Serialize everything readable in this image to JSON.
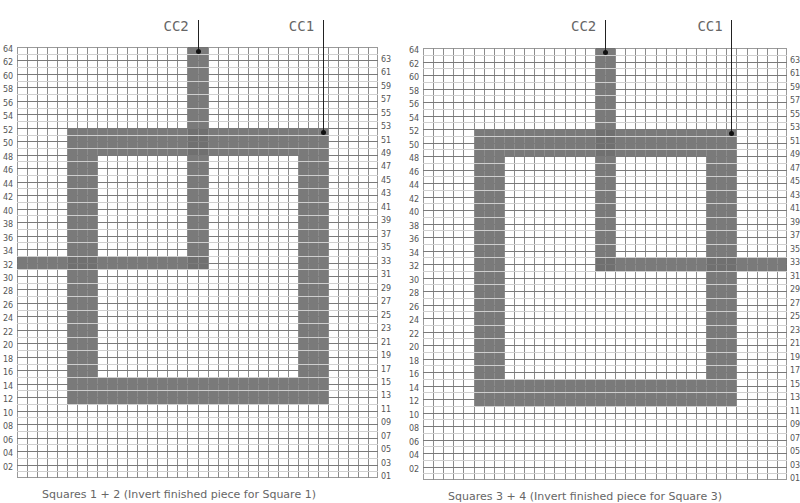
{
  "diagram": {
    "grid": {
      "columns": 36,
      "rows": 64
    },
    "fill_color": "#6f6f6f",
    "panels": [
      {
        "id": "left",
        "caption": "Squares 1 + 2 (Invert finished piece for Square 1)",
        "left_labels": [
          "64",
          "62",
          "60",
          "58",
          "56",
          "54",
          "52",
          "50",
          "48",
          "46",
          "44",
          "42",
          "40",
          "38",
          "36",
          "34",
          "32",
          "30",
          "28",
          "26",
          "24",
          "22",
          "20",
          "18",
          "16",
          "14",
          "12",
          "10",
          "08",
          "06",
          "04",
          "02"
        ],
        "right_labels": [
          "63",
          "61",
          "59",
          "57",
          "55",
          "53",
          "51",
          "49",
          "47",
          "45",
          "43",
          "41",
          "39",
          "37",
          "35",
          "33",
          "31",
          "29",
          "27",
          "25",
          "23",
          "21",
          "19",
          "17",
          "15",
          "13",
          "11",
          "09",
          "07",
          "05",
          "03",
          "01"
        ],
        "markers": [
          {
            "label": "CC2",
            "col": 18,
            "row": 64
          },
          {
            "label": "CC1",
            "col": 30.5,
            "row": 52
          }
        ],
        "shapes": [
          {
            "name": "square-outline",
            "col_start": 5,
            "col_end": 31,
            "row_start": 12,
            "row_end": 52,
            "thickness_cols": 3,
            "thickness_rows": 4
          },
          {
            "name": "cc2-vertical",
            "col_start": 17,
            "col_end": 19,
            "row_start": 32,
            "row_end": 64
          },
          {
            "name": "cc2-horizontal",
            "col_start": 0,
            "col_end": 19,
            "row_start": 32,
            "row_end": 33
          }
        ]
      },
      {
        "id": "right",
        "caption": "Squares 3 + 4 (Invert finished piece for Square 3)",
        "left_labels": [
          "64",
          "62",
          "60",
          "58",
          "56",
          "54",
          "52",
          "50",
          "48",
          "46",
          "44",
          "42",
          "40",
          "38",
          "36",
          "34",
          "32",
          "30",
          "28",
          "26",
          "24",
          "22",
          "20",
          "18",
          "16",
          "14",
          "12",
          "10",
          "08",
          "06",
          "04",
          "02"
        ],
        "right_labels": [
          "63",
          "61",
          "59",
          "57",
          "55",
          "53",
          "51",
          "49",
          "47",
          "45",
          "43",
          "41",
          "39",
          "37",
          "35",
          "33",
          "31",
          "29",
          "27",
          "25",
          "23",
          "21",
          "19",
          "17",
          "15",
          "13",
          "11",
          "09",
          "07",
          "05",
          "03",
          "01"
        ],
        "markers": [
          {
            "label": "CC2",
            "col": 18,
            "row": 64
          },
          {
            "label": "CC1",
            "col": 30.5,
            "row": 52
          }
        ],
        "shapes": [
          {
            "name": "square-outline",
            "col_start": 5,
            "col_end": 31,
            "row_start": 12,
            "row_end": 52,
            "thickness_cols": 3,
            "thickness_rows": 4
          },
          {
            "name": "cc2-vertical",
            "col_start": 17,
            "col_end": 19,
            "row_start": 32,
            "row_end": 64
          },
          {
            "name": "cc2-horizontal",
            "col_start": 17,
            "col_end": 36,
            "row_start": 32,
            "row_end": 33
          }
        ]
      }
    ]
  }
}
